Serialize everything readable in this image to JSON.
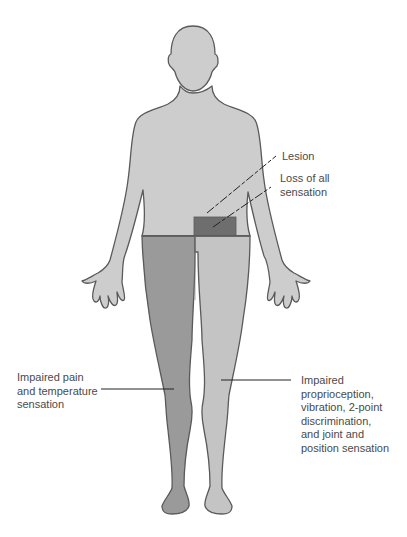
{
  "diagram": {
    "type": "body-sensory-deficit-map",
    "view": "anterior full body"
  },
  "colors": {
    "body_fill": "#cdcdcd",
    "outline": "#5a5a5a",
    "pain_temp_side": "#9a9a9a",
    "proprioception_side": "#c4c4c4",
    "lesion_region": "#6e6e6e",
    "label_text": "#4a4a4a",
    "leader_line": "#222222"
  },
  "labels": {
    "lesion": "Lesion",
    "loss_of_sensation": [
      "Loss of all",
      "sensation"
    ],
    "pain_temperature": [
      "Impaired pain",
      "and temperature",
      "sensation"
    ],
    "proprioception": [
      "Impaired",
      "proprioception,",
      "vibration, 2-point",
      "discrimination,",
      "and joint and",
      "position sensation"
    ]
  }
}
